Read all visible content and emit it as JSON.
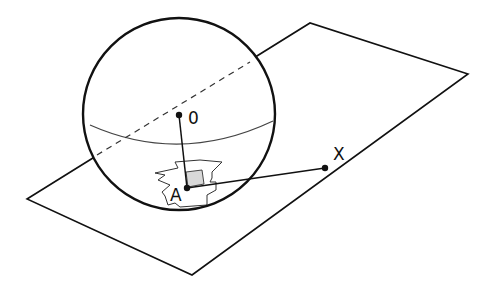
{
  "diagram": {
    "title": "",
    "labels": {
      "center": "0",
      "tangent_point": "A",
      "external_point": "X"
    },
    "colors": {
      "stroke": "#111111",
      "patch_fill": "#d8d8d8",
      "background": "#ffffff"
    },
    "elements": [
      {
        "type": "plane",
        "description": "tangent plane (parallelogram)"
      },
      {
        "type": "sphere",
        "description": "sphere with center 0"
      },
      {
        "type": "equator",
        "description": "equatorial curve of sphere"
      },
      {
        "type": "dashed-line",
        "description": "hidden line through center 0"
      },
      {
        "type": "segment",
        "from": "0",
        "to": "A",
        "description": "radius to tangent point"
      },
      {
        "type": "segment",
        "from": "A",
        "to": "X",
        "description": "segment in plane from A to X"
      },
      {
        "type": "patch",
        "description": "irregular region around A with right-angle marker"
      }
    ]
  }
}
